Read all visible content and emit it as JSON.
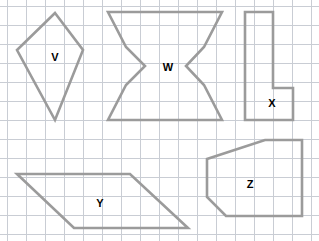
{
  "canvas": {
    "width": 319,
    "height": 241,
    "background_color": "#ffffff",
    "description": "Worksheet grid with five outlined geometric shapes labeled V, W, X, Y and Z"
  },
  "grid": {
    "line_color": "#c9cdd4",
    "cell_size": 19,
    "origin_x": 7,
    "origin_y": 6,
    "columns": 17,
    "rows": 13,
    "visible": true
  },
  "style": {
    "shape_stroke_color": "#9b9b9b",
    "shape_stroke_width": 2.6,
    "shape_fill": "none",
    "label_color": "#000000",
    "label_font_size": 11
  },
  "shapes": [
    {
      "id": "shape-v",
      "label": "V",
      "type": "kite",
      "vertex_count": 4,
      "points": "55,13 83,50 55,120 17,50",
      "label_x": 55,
      "label_y": 57
    },
    {
      "id": "shape-w",
      "label": "W",
      "type": "hourglass-hexagon",
      "vertex_count": 10,
      "points": "108,12 222,12 204,47 186,66 204,85 222,120 108,120 126,85 145,66 126,47",
      "label_x": 168,
      "label_y": 67
    },
    {
      "id": "shape-x",
      "label": "X",
      "type": "l-shape",
      "vertex_count": 6,
      "points": "245,12 273,12 273,88 293,88 293,120 245,120",
      "label_x": 272,
      "label_y": 103
    },
    {
      "id": "shape-y",
      "label": "Y",
      "type": "parallelogram",
      "vertex_count": 4,
      "points": "17,174 130,174 188,228 74,228",
      "label_x": 100,
      "label_y": 203
    },
    {
      "id": "shape-z",
      "label": "Z",
      "type": "pentagon",
      "vertex_count": 6,
      "points": "265,140 302,140 302,216 226,216 207,197 207,159",
      "label_x": 250,
      "label_y": 184
    }
  ]
}
